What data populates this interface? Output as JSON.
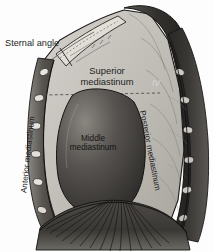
{
  "figure": {
    "background_color": "#fdfdfd",
    "ink_color": "#1d1d1d"
  },
  "labels": {
    "sternal_angle": "Sternal angle",
    "superior_line1": "Superior",
    "superior_line2": "mediastinum",
    "middle_line1": "Middle",
    "middle_line2": "mediastinum",
    "anterior": "Anterior mediastinum",
    "posterior": "Posterior mediastinum",
    "vertebra": "IV"
  },
  "palette": {
    "cavity_light": "#cfcdc8",
    "cavity_mid": "#b4b1ab",
    "heart_dark": "#3a3835",
    "heart_mid": "#6e6a64",
    "spine_dark": "#2e2c2a",
    "rib_fill": "#d9d6d0",
    "diaphragm": "#45423e",
    "outline": "#1c1b1a"
  },
  "structures": [
    {
      "name": "sternum",
      "shade": "light"
    },
    {
      "name": "vertebral-column",
      "shade": "dark"
    },
    {
      "name": "rib-cross-sections",
      "shade": "light"
    },
    {
      "name": "heart-middle-mediastinum",
      "shade": "dark"
    },
    {
      "name": "diaphragm",
      "shade": "dark"
    },
    {
      "name": "superior-inferior-divider",
      "style": "dashed"
    }
  ]
}
